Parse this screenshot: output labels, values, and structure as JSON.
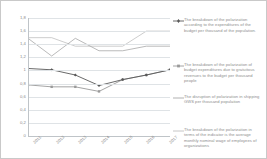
{
  "chart_data": {
    "type": "line",
    "title": "",
    "xlabel": "",
    "ylabel": "",
    "categories": [
      "2011",
      "2012",
      "2013",
      "2014",
      "2015",
      "2016",
      "2017"
    ],
    "ylim": [
      0,
      1.8
    ],
    "yticks": [
      "0",
      "0,2",
      "0,4",
      "0,6",
      "0,8",
      "1",
      "1,2",
      "1,4",
      "1,6",
      "1,8"
    ],
    "ytick_values": [
      0,
      0.2,
      0.4,
      0.6,
      0.8,
      1.0,
      1.2,
      1.4,
      1.6,
      1.8
    ],
    "grid": true,
    "legend_position": "right",
    "decimal_separator": ",",
    "series": [
      {
        "name": "The breakdown of the polarization according to the expenditures of the budget per thousand of the population.",
        "color": "#595959",
        "marker": "diamond",
        "values": [
          1.03,
          1.01,
          0.93,
          0.77,
          0.86,
          0.93,
          1.01
        ]
      },
      {
        "name": "The breakdown of the polarization of budget expenditures due to gratuitous revenues to the budget per thousand people",
        "color": "#9a9a9a",
        "marker": "square",
        "values": [
          0.78,
          0.75,
          0.75,
          0.68,
          0.86,
          0.93,
          1.01
        ]
      },
      {
        "name": "The disruption of polarization in shipping GWS per thousand population",
        "color": "#a8a8a8",
        "marker": "none",
        "values": [
          1.49,
          1.22,
          1.49,
          1.3,
          1.3,
          1.37,
          1.37
        ]
      },
      {
        "name": "The breakdown of the polarization in terms of the indicator is the average monthly nominal wage of employees of organizations",
        "color": "#c0c0c0",
        "marker": "none",
        "values": [
          1.5,
          1.5,
          1.37,
          1.37,
          1.37,
          1.6,
          1.6
        ]
      }
    ]
  },
  "colors": {
    "grid": "#dfe3e6",
    "axis": "#bfc4c8",
    "tick_label": "#8a8a8a",
    "legend_text": "#8d8d8d",
    "border": "#c9c9c9",
    "background": "#ffffff"
  }
}
